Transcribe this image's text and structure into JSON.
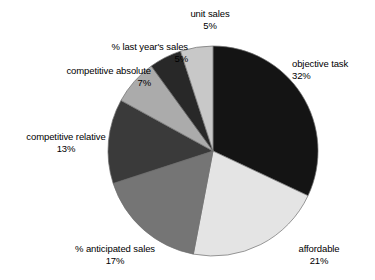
{
  "chart_data": {
    "type": "pie",
    "title": "",
    "subtitle": "",
    "xlabel": "",
    "ylabel": "",
    "legend_position": "none",
    "grid": false,
    "value_unit": "%",
    "start_angle_deg": 0,
    "direction": "clockwise",
    "categories": [
      "objective task",
      "affordable",
      "% anticipated sales",
      "competitive relative",
      "competitive absolute",
      "% last year's sales",
      "unit sales"
    ],
    "values": [
      32,
      21,
      17,
      13,
      7,
      5,
      5
    ],
    "slices": [
      {
        "label": "objective task",
        "value": 32,
        "value_text": "32%",
        "color": "#141414",
        "label_align": "left"
      },
      {
        "label": "affordable",
        "value": 21,
        "value_text": "21%",
        "color": "#e4e4e4",
        "label_align": "left"
      },
      {
        "label": "% anticipated sales",
        "value": 17,
        "value_text": "17%",
        "color": "#757575",
        "label_align": "center"
      },
      {
        "label": "competitive relative",
        "value": 13,
        "value_text": "13%",
        "color": "#3a3a3a",
        "label_align": "center"
      },
      {
        "label": "competitive absolute",
        "value": 7,
        "value_text": "7%",
        "color": "#ababab",
        "label_align": "center"
      },
      {
        "label": "% last year's sales",
        "value": 5,
        "value_text": "5%",
        "color": "#282828",
        "label_align": "center"
      },
      {
        "label": "unit sales",
        "value": 5,
        "value_text": "5%",
        "color": "#c8c8c8",
        "label_align": "center"
      }
    ]
  },
  "geometry": {
    "center_x": 213,
    "center_y": 151,
    "radius": 105,
    "outline_color": "#6e6e6e"
  },
  "background": "#ffffff"
}
